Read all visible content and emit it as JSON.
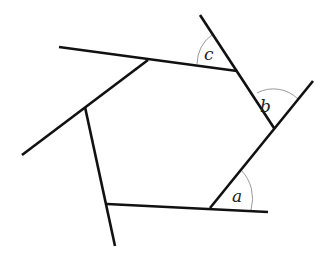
{
  "diagram": {
    "type": "polygon-exterior-angles",
    "colors": {
      "line": "#111111",
      "arc": "#9a9a9a",
      "label": "#222222",
      "background": "#ffffff"
    },
    "lines": [
      {
        "id": "top-side-extended",
        "x1": 59,
        "y1": 47,
        "x2": 237,
        "y2": 71
      },
      {
        "id": "upper-left-side-extended",
        "x1": 148,
        "y1": 60,
        "x2": 22,
        "y2": 155
      },
      {
        "id": "left-side-extended",
        "x1": 85,
        "y1": 107,
        "x2": 115,
        "y2": 246
      },
      {
        "id": "bottom-side-extended",
        "x1": 107,
        "y1": 204,
        "x2": 268,
        "y2": 212
      },
      {
        "id": "lower-right-side-extended",
        "x1": 210,
        "y1": 208,
        "x2": 313,
        "y2": 81
      },
      {
        "id": "upper-right-side-extended",
        "x1": 200,
        "y1": 15,
        "x2": 274,
        "y2": 128
      }
    ],
    "angles": [
      {
        "label": "a",
        "x": 232,
        "y": 202,
        "arc": "M 241 170 A 41 41 0 0 1 251 210"
      },
      {
        "label": "b",
        "x": 260,
        "y": 112,
        "arc": "M 257 93 A 35 35 0 0 1 298 99"
      },
      {
        "label": "c",
        "x": 204,
        "y": 60,
        "arc": "M 197 64 A 38 38 0 0 1 213 34"
      }
    ]
  }
}
